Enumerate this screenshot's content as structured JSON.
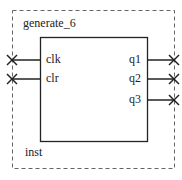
{
  "diagram": {
    "instance_name": "generate_6",
    "instance_label": "inst",
    "inputs": [
      {
        "name": "clk"
      },
      {
        "name": "clr"
      }
    ],
    "outputs": [
      {
        "name": "q1"
      },
      {
        "name": "q2"
      },
      {
        "name": "q3"
      }
    ],
    "colors": {
      "line": "#222222",
      "dashed_border": "#666666",
      "background": "#ffffff"
    }
  }
}
